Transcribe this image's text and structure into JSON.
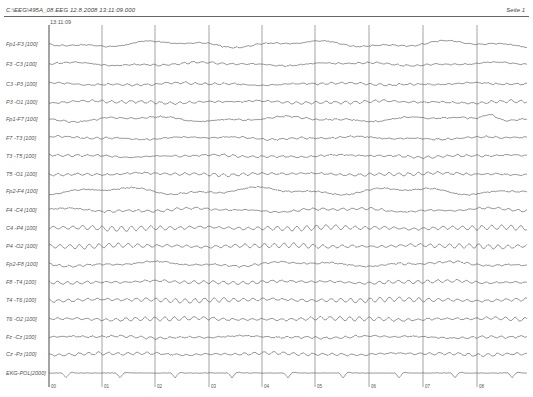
{
  "header": {
    "title": "C:\\EEG\\495A_08.EEG  12.8.2008  13:11:09.000",
    "page": "Seite 1",
    "start_time": "13:11:09"
  },
  "chart_data": {
    "type": "line",
    "title": "C:\\EEG\\495A_08.EEG 12.8.2008 13:11:09.000",
    "subtitle": "13:11:09",
    "xlabel": "seconds",
    "ylabel": "",
    "x_ticks": [
      "00",
      "01",
      "02",
      "03",
      "04",
      "05",
      "06",
      "07",
      "08"
    ],
    "x_range": [
      0,
      9
    ],
    "grid": "vertical lines every 1 s",
    "series": [
      {
        "name": "Fp1-F3 [100]",
        "y": 44,
        "alpha": 0.5,
        "slow": 2.2,
        "noise": 0.8
      },
      {
        "name": "F3 -C3 [100]",
        "y": 64,
        "alpha": 0.8,
        "slow": 1.2,
        "noise": 0.8
      },
      {
        "name": "C3 -P3 [100]",
        "y": 84,
        "alpha": 1.0,
        "slow": 0.8,
        "noise": 0.8
      },
      {
        "name": "P3 -O1 [100]",
        "y": 102,
        "alpha": 1.3,
        "slow": 0.8,
        "noise": 0.8
      },
      {
        "name": "Fp1-F7 [100]",
        "y": 119,
        "alpha": 0.6,
        "slow": 1.8,
        "noise": 0.9,
        "bump_x": 490,
        "bump_h": -7
      },
      {
        "name": "F7 -T3 [100]",
        "y": 138,
        "alpha": 0.7,
        "slow": 1.0,
        "noise": 0.9
      },
      {
        "name": "T3 -T5 [100]",
        "y": 156,
        "alpha": 1.0,
        "slow": 0.8,
        "noise": 0.8
      },
      {
        "name": "T5 -O1 [100]",
        "y": 174,
        "alpha": 1.4,
        "slow": 0.7,
        "noise": 0.8
      },
      {
        "name": "Fp2-F4 [100]",
        "y": 191,
        "alpha": 0.5,
        "slow": 2.5,
        "noise": 0.9
      },
      {
        "name": "F4 -C4 [100]",
        "y": 210,
        "alpha": 1.1,
        "slow": 1.3,
        "noise": 0.8
      },
      {
        "name": "C4 -P4 [100]",
        "y": 228,
        "alpha": 2.4,
        "slow": 0.6,
        "noise": 0.6
      },
      {
        "name": "P4 -O2 [100]",
        "y": 246,
        "alpha": 2.2,
        "slow": 0.6,
        "noise": 0.6
      },
      {
        "name": "Fp2-F8 [100]",
        "y": 264,
        "alpha": 0.8,
        "slow": 1.6,
        "noise": 0.9
      },
      {
        "name": "F8 -T4 [100]",
        "y": 282,
        "alpha": 1.6,
        "slow": 0.8,
        "noise": 0.7
      },
      {
        "name": "T4 -T6 [100]",
        "y": 300,
        "alpha": 2.3,
        "slow": 0.6,
        "noise": 0.6
      },
      {
        "name": "T6 -O2 [100]",
        "y": 319,
        "alpha": 2.0,
        "slow": 0.6,
        "noise": 0.6
      },
      {
        "name": "Fz -Cz [100]",
        "y": 337,
        "alpha": 1.0,
        "slow": 0.8,
        "noise": 0.8
      },
      {
        "name": "Cz -Pz [100]",
        "y": 354,
        "alpha": 1.4,
        "slow": 0.7,
        "noise": 0.7
      },
      {
        "name": "EKG-POL[2000]",
        "y": 373,
        "ekg": true
      }
    ],
    "ekg_beats_x": [
      66,
      120,
      175,
      232,
      288,
      343,
      399,
      455,
      512
    ]
  },
  "layout": {
    "plot_left": 49,
    "plot_right": 527,
    "grid_x": [
      49,
      102,
      155,
      209,
      262,
      315,
      369,
      423,
      477
    ],
    "grid_top": 25,
    "grid_bottom": 387,
    "trace_color": "#555555",
    "grid_color": "#666666"
  }
}
